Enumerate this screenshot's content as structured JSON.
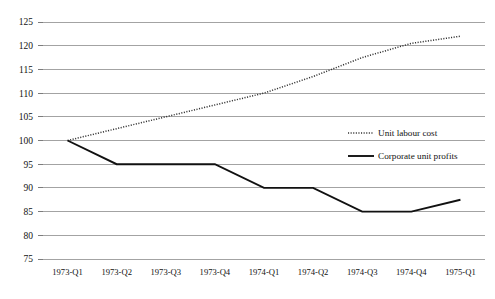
{
  "chart_data": {
    "type": "line",
    "title": "",
    "subtitle": "",
    "xlabel": "",
    "ylabel": "",
    "x": [
      "1973-Q1",
      "1973-Q2",
      "1973-Q3",
      "1973-Q4",
      "1974-Q1",
      "1974-Q2",
      "1974-Q3",
      "1974-Q4",
      "1975-Q1"
    ],
    "categories": [
      "1973-Q1",
      "1973-Q2",
      "1973-Q3",
      "1973-Q4",
      "1974-Q1",
      "1974-Q2",
      "1974-Q3",
      "1974-Q4",
      "1975-Q1"
    ],
    "series": [
      {
        "name": "Unit labour cost",
        "style": "dotted",
        "color": "#333333",
        "values": [
          100,
          102.5,
          105,
          107.5,
          110,
          113.5,
          117.5,
          120.5,
          122
        ]
      },
      {
        "name": "Corporate unit profits",
        "style": "solid",
        "color": "#111111",
        "values": [
          100,
          95,
          95,
          95,
          90,
          90,
          85,
          85,
          87.5
        ]
      }
    ],
    "ylim": [
      75,
      125
    ],
    "yticks": [
      75,
      80,
      85,
      90,
      95,
      100,
      105,
      110,
      115,
      120,
      125
    ],
    "ytick_labels": [
      "75",
      "80",
      "85",
      "90",
      "95",
      "100",
      "105",
      "110",
      "115",
      "120",
      "125"
    ],
    "grid": true,
    "grid_axis": "y",
    "legend_position": "center-right-inside",
    "background_color": "#ffffff",
    "gridline_color": "#8c8c8c"
  },
  "legend": {
    "entries": [
      {
        "label": "Unit labour cost",
        "style": "dotted"
      },
      {
        "label": "Corporate unit profits",
        "style": "solid"
      }
    ]
  }
}
